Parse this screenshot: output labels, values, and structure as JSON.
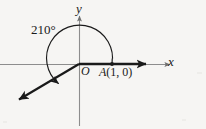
{
  "figure": {
    "type": "angle-in-standard-position-diagram",
    "background_color": "#f6f5f3",
    "stroke_color": "#1a1a1a",
    "axis_color": "#8d8d8d",
    "labels": {
      "y_axis": "y",
      "x_axis": "x",
      "origin": "O",
      "point_a": "A(1, 0)",
      "point_a_name": "A",
      "point_a_coords": "(1, 0)",
      "angle_measure": "210°"
    },
    "geometry": {
      "origin_px": [
        79,
        64
      ],
      "point_a_px": [
        112,
        64
      ],
      "arc_radius_px": 33,
      "angle_degrees": 210,
      "initial_side_direction_degrees": 0,
      "terminal_side_direction_degrees": 210,
      "arc_sweep": "counterclockwise",
      "initial_ray_end_px": [
        150,
        64
      ],
      "terminal_ray_end_px": [
        14,
        103
      ],
      "arc_arrow_tip_px": [
        53,
        73
      ],
      "y_axis_top_px": [
        79,
        15
      ],
      "y_axis_bottom_px": [
        79,
        126
      ],
      "x_axis_left_px": [
        0,
        64
      ],
      "x_axis_right_px": [
        172,
        64
      ]
    }
  }
}
